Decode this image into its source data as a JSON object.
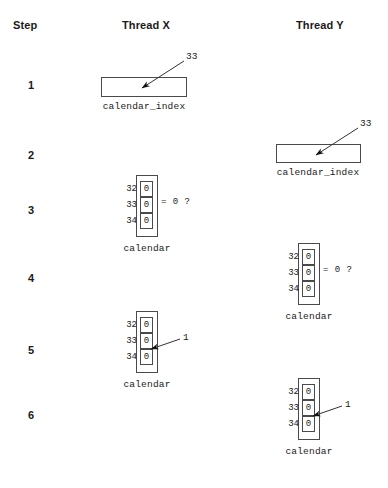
{
  "diagram": {
    "headers": {
      "step": "Step",
      "thread_x": "Thread X",
      "thread_y": "Thread Y"
    },
    "steps": [
      "1",
      "2",
      "3",
      "4",
      "5",
      "6"
    ],
    "labels": {
      "calendar_index": "calendar_index",
      "calendar": "calendar",
      "compare": "= 0 ?",
      "index_value": "33",
      "written_value": "1"
    },
    "array_rows": [
      {
        "index": "32",
        "value": "0"
      },
      {
        "index": "33",
        "value": "0"
      },
      {
        "index": "34",
        "value": "0"
      }
    ],
    "panels": [
      {
        "step": "1",
        "column": "thread_x",
        "type": "variable-box",
        "variable": "calendar_index",
        "pointer_label": "33"
      },
      {
        "step": "2",
        "column": "thread_y",
        "type": "variable-box",
        "variable": "calendar_index",
        "pointer_label": "33"
      },
      {
        "step": "3",
        "column": "thread_x",
        "type": "array",
        "variable": "calendar",
        "annotation": "= 0 ?",
        "highlight_index": "33"
      },
      {
        "step": "4",
        "column": "thread_y",
        "type": "array",
        "variable": "calendar",
        "annotation": "= 0 ?",
        "highlight_index": "33"
      },
      {
        "step": "5",
        "column": "thread_x",
        "type": "array",
        "variable": "calendar",
        "pointer_label": "1",
        "highlight_index": "33"
      },
      {
        "step": "6",
        "column": "thread_y",
        "type": "array",
        "variable": "calendar",
        "pointer_label": "1",
        "highlight_index": "33"
      }
    ],
    "colors": {
      "line": "#4a4a4a",
      "text": "#1a1a1a",
      "background": "#ffffff"
    }
  }
}
